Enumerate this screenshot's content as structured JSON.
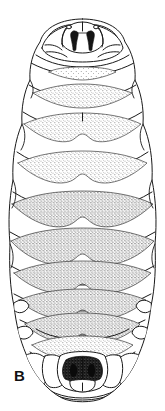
{
  "figure": {
    "panel_label": "B",
    "view": "dorsal-whole-body",
    "style": "ink-line-drawing-stippled",
    "background_color": "#ffffff",
    "line_color": "#1a1a1a",
    "stipple_color": "#2b2b2b",
    "dark_fill_color": "#151515",
    "canvas": {
      "width": 165,
      "height": 411
    }
  },
  "anatomy": {
    "head_region": {
      "name": "cephalic-segment",
      "label": "head with mouthhooks",
      "mouthhooks_count": 2,
      "y_top": 20,
      "y_bottom": 58
    },
    "terminal_region": {
      "name": "terminal-segment",
      "label": "posterior spiracular plate",
      "y_top": 340,
      "y_bottom": 402
    },
    "segments": [
      {
        "index": 1,
        "name": "segment-1",
        "label": "T1",
        "cy": 62,
        "half_width": 42,
        "stipple": "light"
      },
      {
        "index": 2,
        "name": "segment-2",
        "label": "T2",
        "cy": 92,
        "half_width": 52,
        "stipple": "medium"
      },
      {
        "index": 3,
        "name": "segment-3",
        "label": "T3",
        "cy": 126,
        "half_width": 58,
        "stipple": "medium"
      },
      {
        "index": 4,
        "name": "segment-4",
        "label": "A1",
        "cy": 164,
        "half_width": 63,
        "stipple": "medium"
      },
      {
        "index": 5,
        "name": "segment-5",
        "label": "A2",
        "cy": 204,
        "half_width": 66,
        "stipple": "heavy"
      },
      {
        "index": 6,
        "name": "segment-6",
        "label": "A3",
        "cy": 240,
        "half_width": 68,
        "stipple": "heavy"
      },
      {
        "index": 7,
        "name": "segment-7",
        "label": "A4",
        "cy": 272,
        "half_width": 66,
        "stipple": "heavy"
      },
      {
        "index": 8,
        "name": "segment-8",
        "label": "A5",
        "cy": 300,
        "half_width": 62,
        "stipple": "heavy"
      },
      {
        "index": 9,
        "name": "segment-9",
        "label": "A6",
        "cy": 324,
        "half_width": 56,
        "stipple": "medium"
      },
      {
        "index": 10,
        "name": "segment-10",
        "label": "A7",
        "cy": 345,
        "half_width": 50,
        "stipple": "medium"
      }
    ]
  }
}
